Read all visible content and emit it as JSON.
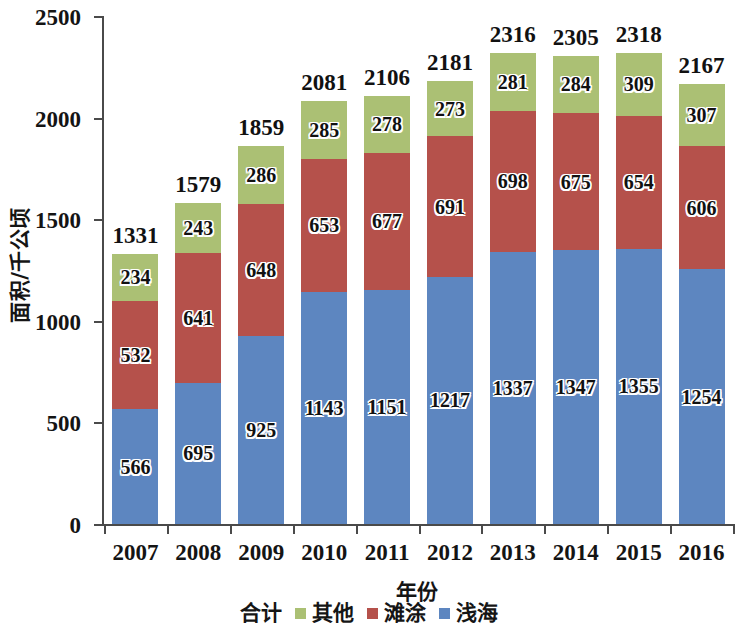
{
  "chart_data": {
    "type": "bar",
    "stacked": true,
    "title": "",
    "xlabel": "年份",
    "ylabel": "面积/千公顷",
    "categories": [
      "2007",
      "2008",
      "2009",
      "2010",
      "2011",
      "2012",
      "2013",
      "2014",
      "2015",
      "2016"
    ],
    "series": [
      {
        "name": "浅海",
        "color": "#5d86c0",
        "values": [
          566,
          695,
          925,
          1143,
          1151,
          1217,
          1337,
          1347,
          1355,
          1254
        ]
      },
      {
        "name": "滩涂",
        "color": "#b5514b",
        "values": [
          532,
          641,
          648,
          653,
          677,
          691,
          698,
          675,
          654,
          606
        ]
      },
      {
        "name": "其他",
        "color": "#abc074",
        "values": [
          234,
          243,
          286,
          285,
          278,
          273,
          281,
          284,
          309,
          307
        ]
      }
    ],
    "totals": [
      1331,
      1579,
      1859,
      2081,
      2106,
      2181,
      2316,
      2305,
      2318,
      2167
    ],
    "total_series_name": "合计",
    "ylim": [
      0,
      2500
    ],
    "yticks": [
      0,
      500,
      1000,
      1500,
      2000,
      2500
    ],
    "ytick_labels": [
      "0",
      "500",
      "1000",
      "1500",
      "2000",
      "2500"
    ],
    "grid": false,
    "legend_position": "bottom",
    "legend": [
      {
        "label": "合计",
        "swatch": false,
        "color": ""
      },
      {
        "label": "其他",
        "swatch": true,
        "color": "#abc074"
      },
      {
        "label": "滩涂",
        "swatch": true,
        "color": "#b5514b"
      },
      {
        "label": "浅海",
        "swatch": true,
        "color": "#5d86c0"
      }
    ]
  }
}
